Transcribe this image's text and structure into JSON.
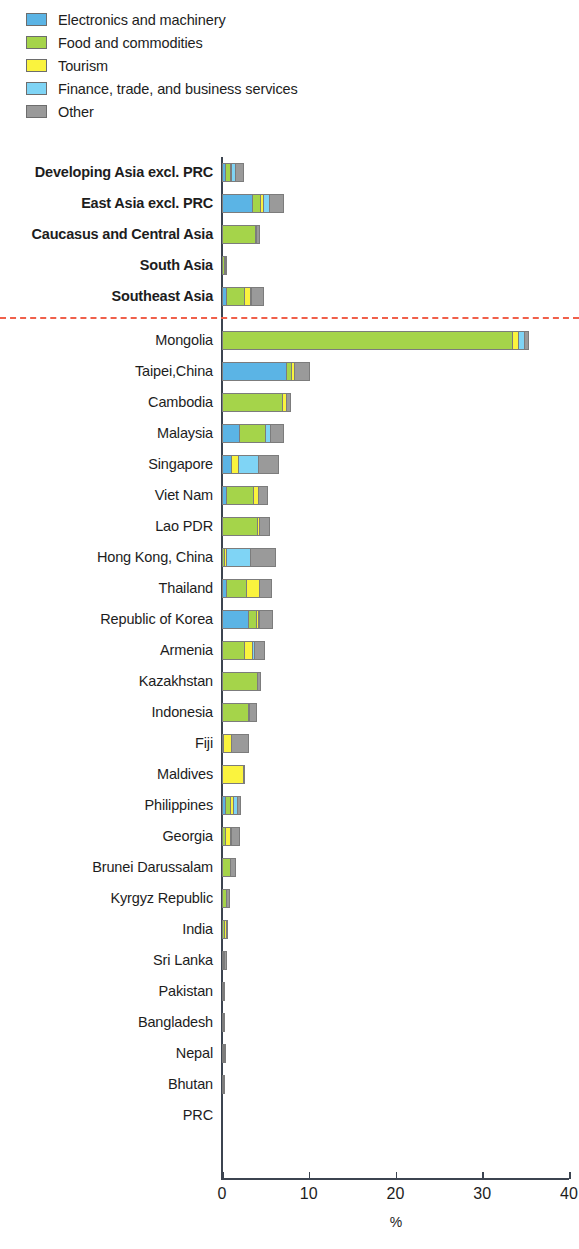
{
  "legend": {
    "items": [
      {
        "label": "Electronics and machinery",
        "key": "electronics",
        "color": "#5BB4E5",
        "icon": "legend-swatch-icon"
      },
      {
        "label": "Food and commodities",
        "key": "food",
        "color": "#A5D44A",
        "icon": "legend-swatch-icon"
      },
      {
        "label": "Tourism",
        "key": "tourism",
        "color": "#FAF33E",
        "icon": "legend-swatch-icon"
      },
      {
        "label": "Finance, trade, and business services",
        "key": "finance",
        "color": "#7FD4F5",
        "icon": "legend-swatch-icon"
      },
      {
        "label": "Other",
        "key": "other",
        "color": "#9A9A9A",
        "icon": "legend-swatch-icon"
      }
    ]
  },
  "chart_data": {
    "type": "bar",
    "orientation": "horizontal",
    "stacked": true,
    "title": "",
    "xlabel": "%",
    "ylabel": "",
    "xlim": [
      0,
      40
    ],
    "xticks": [
      0,
      10,
      20,
      30,
      40
    ],
    "xtick_labels": [
      "0",
      "10",
      "20",
      "30",
      "40"
    ],
    "grid": false,
    "legend_position": "top-left",
    "series": [
      {
        "name": "Electronics and machinery",
        "key": "electronics",
        "color": "#5BB4E5"
      },
      {
        "name": "Food and commodities",
        "key": "food",
        "color": "#A5D44A"
      },
      {
        "name": "Tourism",
        "key": "tourism",
        "color": "#FAF33E"
      },
      {
        "name": "Finance, trade, and business services",
        "key": "finance",
        "color": "#7FD4F5"
      },
      {
        "name": "Other",
        "key": "other",
        "color": "#9A9A9A"
      }
    ],
    "separator_after_category": "Southeast Asia",
    "separator_color": "#F0604A",
    "categories": [
      {
        "label": "Developing Asia excl. PRC",
        "group": true,
        "values": {
          "electronics": 0.5,
          "food": 0.5,
          "tourism": 0.2,
          "finance": 0.4,
          "other": 0.9
        }
      },
      {
        "label": "East Asia excl. PRC",
        "group": true,
        "values": {
          "electronics": 3.6,
          "food": 0.9,
          "tourism": 0.3,
          "finance": 0.7,
          "other": 1.6
        }
      },
      {
        "label": "Caucasus and Central Asia",
        "group": true,
        "values": {
          "electronics": 0.0,
          "food": 3.9,
          "tourism": 0.1,
          "finance": 0.0,
          "other": 0.3
        }
      },
      {
        "label": "South Asia",
        "group": true,
        "values": {
          "electronics": 0.0,
          "food": 0.3,
          "tourism": 0.05,
          "finance": 0.0,
          "other": 0.1
        }
      },
      {
        "label": "Southeast Asia",
        "group": true,
        "values": {
          "electronics": 0.6,
          "food": 2.1,
          "tourism": 0.6,
          "finance": 0.2,
          "other": 1.3
        }
      },
      {
        "label": "Mongolia",
        "group": false,
        "values": {
          "electronics": 0.0,
          "food": 33.6,
          "tourism": 0.6,
          "finance": 0.7,
          "other": 0.5
        }
      },
      {
        "label": "Taipei,China",
        "group": false,
        "values": {
          "electronics": 7.5,
          "food": 0.6,
          "tourism": 0.3,
          "finance": 0.0,
          "other": 1.8
        }
      },
      {
        "label": "Cambodia",
        "group": false,
        "values": {
          "electronics": 0.0,
          "food": 7.0,
          "tourism": 0.5,
          "finance": 0.0,
          "other": 0.4
        }
      },
      {
        "label": "Malaysia",
        "group": false,
        "values": {
          "electronics": 2.1,
          "food": 3.0,
          "tourism": 0.0,
          "finance": 0.6,
          "other": 1.4
        }
      },
      {
        "label": "Singapore",
        "group": false,
        "values": {
          "electronics": 1.1,
          "food": 0.0,
          "tourism": 0.9,
          "finance": 2.3,
          "other": 2.3
        }
      },
      {
        "label": "Viet Nam",
        "group": false,
        "values": {
          "electronics": 0.6,
          "food": 3.1,
          "tourism": 0.6,
          "finance": 0.0,
          "other": 1.0
        }
      },
      {
        "label": "Lao PDR",
        "group": false,
        "values": {
          "electronics": 0.0,
          "food": 4.2,
          "tourism": 0.2,
          "finance": 0.0,
          "other": 1.1
        }
      },
      {
        "label": "Hong Kong, China",
        "group": false,
        "values": {
          "electronics": 0.0,
          "food": 0.4,
          "tourism": 0.2,
          "finance": 2.8,
          "other": 2.8
        }
      },
      {
        "label": "Thailand",
        "group": false,
        "values": {
          "electronics": 0.6,
          "food": 2.3,
          "tourism": 1.5,
          "finance": 0.0,
          "other": 1.4
        }
      },
      {
        "label": "Republic of Korea",
        "group": false,
        "values": {
          "electronics": 3.1,
          "food": 0.9,
          "tourism": 0.3,
          "finance": 0.1,
          "other": 1.4
        }
      },
      {
        "label": "Armenia",
        "group": false,
        "values": {
          "electronics": 0.0,
          "food": 2.7,
          "tourism": 0.9,
          "finance": 0.2,
          "other": 1.2
        }
      },
      {
        "label": "Kazakhstan",
        "group": false,
        "values": {
          "electronics": 0.0,
          "food": 4.2,
          "tourism": 0.0,
          "finance": 0.0,
          "other": 0.3
        }
      },
      {
        "label": "Indonesia",
        "group": false,
        "values": {
          "electronics": 0.0,
          "food": 3.1,
          "tourism": 0.1,
          "finance": 0.0,
          "other": 0.8
        }
      },
      {
        "label": "Fiji",
        "group": false,
        "values": {
          "electronics": 0.0,
          "food": 0.1,
          "tourism": 0.9,
          "finance": 0.0,
          "other": 2.0
        }
      },
      {
        "label": "Maldives",
        "group": false,
        "values": {
          "electronics": 0.0,
          "food": 0.0,
          "tourism": 2.5,
          "finance": 0.0,
          "other": 0.1
        }
      },
      {
        "label": "Philippines",
        "group": false,
        "values": {
          "electronics": 0.5,
          "food": 0.5,
          "tourism": 0.4,
          "finance": 0.4,
          "other": 0.4
        }
      },
      {
        "label": "Georgia",
        "group": false,
        "values": {
          "electronics": 0.0,
          "food": 0.5,
          "tourism": 0.5,
          "finance": 0.1,
          "other": 0.9
        }
      },
      {
        "label": "Brunei Darussalam",
        "group": false,
        "values": {
          "electronics": 0.0,
          "food": 1.0,
          "tourism": 0.0,
          "finance": 0.0,
          "other": 0.6
        }
      },
      {
        "label": "Kyrgyz Republic",
        "group": false,
        "values": {
          "electronics": 0.0,
          "food": 0.6,
          "tourism": 0.0,
          "finance": 0.0,
          "other": 0.3
        }
      },
      {
        "label": "India",
        "group": false,
        "values": {
          "electronics": 0.0,
          "food": 0.4,
          "tourism": 0.1,
          "finance": 0.0,
          "other": 0.2
        }
      },
      {
        "label": "Sri Lanka",
        "group": false,
        "values": {
          "electronics": 0.0,
          "food": 0.2,
          "tourism": 0.05,
          "finance": 0.0,
          "other": 0.2
        }
      },
      {
        "label": "Pakistan",
        "group": false,
        "values": {
          "electronics": 0.0,
          "food": 0.1,
          "tourism": 0.0,
          "finance": 0.0,
          "other": 0.1
        }
      },
      {
        "label": "Bangladesh",
        "group": false,
        "values": {
          "electronics": 0.0,
          "food": 0.05,
          "tourism": 0.0,
          "finance": 0.0,
          "other": 0.1
        }
      },
      {
        "label": "Nepal",
        "group": false,
        "values": {
          "electronics": 0.0,
          "food": 0.05,
          "tourism": 0.05,
          "finance": 0.0,
          "other": 0.05
        }
      },
      {
        "label": "Bhutan",
        "group": false,
        "values": {
          "electronics": 0.0,
          "food": 0.05,
          "tourism": 0.0,
          "finance": 0.0,
          "other": 0.05
        }
      },
      {
        "label": "PRC",
        "group": false,
        "values": {
          "electronics": 0.0,
          "food": 0.0,
          "tourism": 0.0,
          "finance": 0.0,
          "other": 0.0
        }
      }
    ]
  }
}
